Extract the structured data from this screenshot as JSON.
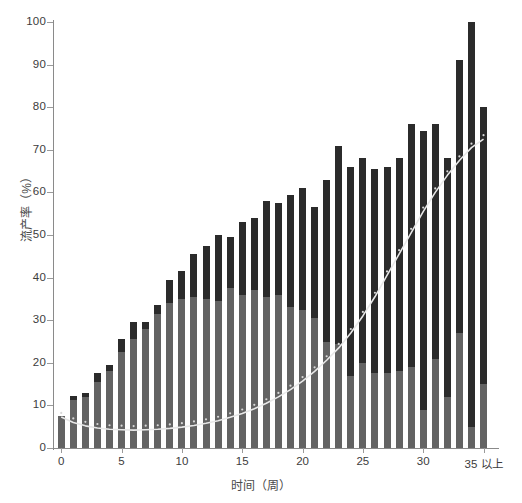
{
  "chart_data": {
    "type": "bar",
    "title": "",
    "xlabel": "时间（周）",
    "ylabel": "流产率（%）",
    "ylim": [
      0,
      100
    ],
    "xlim": [
      -0.6,
      36.2
    ],
    "grid": false,
    "legend": null,
    "y_ticks": [
      0,
      10,
      20,
      30,
      40,
      50,
      60,
      70,
      80,
      90,
      100
    ],
    "y_tick_labels": [
      "0",
      "10",
      "20",
      "30",
      "40",
      "50",
      "60",
      "70",
      "80",
      "90",
      "100"
    ],
    "x_ticks": [
      0,
      5,
      10,
      15,
      20,
      25,
      30,
      35
    ],
    "x_tick_labels": [
      "0",
      "5",
      "10",
      "15",
      "20",
      "25",
      "30",
      "35 以上"
    ],
    "categories": [
      "0",
      "1",
      "2",
      "3",
      "4",
      "5",
      "6",
      "7",
      "8",
      "9",
      "10",
      "11",
      "12",
      "13",
      "14",
      "15",
      "16",
      "17",
      "18",
      "19",
      "20",
      "21",
      "22",
      "23",
      "24",
      "25",
      "26",
      "27",
      "28",
      "29",
      "30",
      "31",
      "32",
      "33",
      "34",
      "35 以上"
    ],
    "series": [
      {
        "name": "上限",
        "kind": "bar",
        "color": "#2b2b2b",
        "values": [
          7.5,
          12.3,
          13.0,
          17.5,
          19.5,
          25.5,
          29.5,
          29.5,
          33.5,
          39.5,
          41.5,
          45.5,
          47.5,
          50.0,
          49.5,
          53.0,
          54.0,
          58.0,
          57.5,
          59.5,
          61.0,
          56.5,
          63.0,
          71.0,
          66.0,
          68.0,
          65.5,
          66.0,
          68.0,
          76.0,
          74.5,
          76.0,
          68.0,
          91.0,
          100.0,
          80.0
        ]
      },
      {
        "name": "下限",
        "kind": "bar",
        "color": "#636363",
        "values": [
          7.5,
          11.3,
          12.0,
          15.5,
          18.0,
          22.5,
          25.5,
          28.0,
          31.5,
          34.0,
          35.0,
          35.5,
          35.0,
          34.5,
          37.5,
          36.0,
          37.0,
          35.5,
          36.0,
          33.0,
          32.5,
          30.5,
          25.0,
          24.5,
          17.0,
          20.0,
          17.5,
          17.5,
          18.0,
          19.0,
          9.0,
          21.0,
          12.0,
          27.0,
          5.0,
          15.0
        ]
      },
      {
        "name": "拟合曲线",
        "kind": "line",
        "color": "#e8e8e8",
        "marker": "dot",
        "values": [
          7.3,
          6.0,
          5.2,
          4.7,
          4.4,
          4.3,
          4.2,
          4.3,
          4.4,
          4.6,
          4.9,
          5.3,
          5.8,
          6.4,
          7.2,
          8.1,
          9.2,
          10.5,
          12.0,
          13.7,
          15.7,
          18.0,
          20.6,
          23.5,
          27.0,
          31.0,
          35.5,
          40.5,
          45.5,
          50.5,
          55.5,
          60.0,
          64.0,
          67.5,
          70.5,
          72.5
        ]
      }
    ]
  }
}
